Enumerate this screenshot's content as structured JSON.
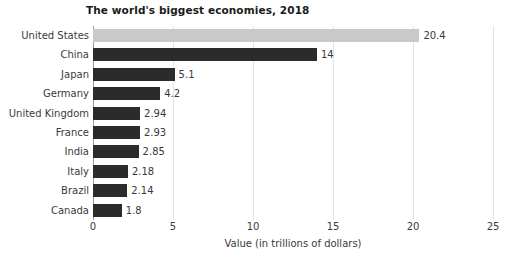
{
  "chart_data": {
    "type": "bar",
    "orientation": "horizontal",
    "title": "The world's biggest economies, 2018",
    "xlabel": "Value (in trillions of dollars)",
    "ylabel": "",
    "xlim": [
      0,
      25
    ],
    "xticks": [
      0,
      5,
      10,
      15,
      20,
      25
    ],
    "xtick_labels": [
      "0",
      "5",
      "10",
      "15",
      "20",
      "25"
    ],
    "grid": true,
    "grid_axis": "x",
    "legend": null,
    "categories": [
      "United States",
      "China",
      "Japan",
      "Germany",
      "United Kingdom",
      "France",
      "India",
      "Italy",
      "Brazil",
      "Canada"
    ],
    "values": [
      20.4,
      14,
      5.1,
      4.2,
      2.94,
      2.93,
      2.85,
      2.18,
      2.14,
      1.8
    ],
    "value_labels": [
      "20.4",
      "14",
      "5.1",
      "4.2",
      "2.94",
      "2.93",
      "2.85",
      "2.18",
      "2.14",
      "1.8"
    ],
    "bar_colors": [
      "#c9c9c9",
      "#2b2b2b",
      "#2b2b2b",
      "#2b2b2b",
      "#2b2b2b",
      "#2b2b2b",
      "#2b2b2b",
      "#2b2b2b",
      "#2b2b2b",
      "#2b2b2b"
    ],
    "highlight_index": 0,
    "colors": {
      "bar_default": "#2b2b2b",
      "bar_highlight": "#c9c9c9",
      "gridline": "#e3e3e3",
      "axis": "#9a9a9a",
      "text": "#3a3a3a",
      "title": "#1a1a1a",
      "background": "#ffffff"
    }
  }
}
